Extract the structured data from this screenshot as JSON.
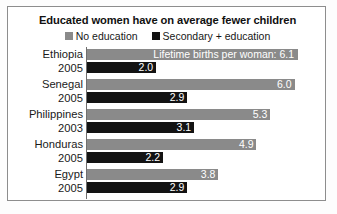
{
  "chart_data": {
    "type": "bar",
    "title": "Educated women have on average fewer children",
    "orientation": "horizontal",
    "grid": false,
    "legend_position": "top-center",
    "xlabel": "",
    "ylabel": "",
    "xlim": [
      0,
      6.1
    ],
    "categories": [
      "Ethiopia 2005",
      "Senegal 2005",
      "Philippines 2003",
      "Honduras 2005",
      "Egypt 2005"
    ],
    "series": [
      {
        "name": "No education",
        "color": "#8a8a8a",
        "values": [
          6.1,
          6.0,
          5.3,
          4.9,
          3.8
        ]
      },
      {
        "name": "Secondary + education",
        "color": "#131313",
        "values": [
          2.0,
          2.9,
          3.1,
          2.2,
          2.9
        ]
      }
    ],
    "annotations": [
      {
        "text": "Lifetime births per woman: 6.1",
        "attached_to": "Ethiopia 2005 / No education"
      }
    ]
  },
  "chart": {
    "title": "Educated women have on average fewer children",
    "legend": [
      {
        "label": "No education",
        "swatch": "gray-swatch-icon"
      },
      {
        "label": "Secondary + education",
        "swatch": "black-swatch-icon"
      }
    ],
    "groups": [
      {
        "country": "Ethiopia",
        "year": "2005",
        "no_education": {
          "value": 6.1,
          "label": "Lifetime births per woman: 6.1"
        },
        "secondary_education": {
          "value": 2.0,
          "label": "2.0"
        }
      },
      {
        "country": "Senegal",
        "year": "2005",
        "no_education": {
          "value": 6.0,
          "label": "6.0"
        },
        "secondary_education": {
          "value": 2.9,
          "label": "2.9"
        }
      },
      {
        "country": "Philippines",
        "year": "2003",
        "no_education": {
          "value": 5.3,
          "label": "5.3"
        },
        "secondary_education": {
          "value": 3.1,
          "label": "3.1"
        }
      },
      {
        "country": "Honduras",
        "year": "2005",
        "no_education": {
          "value": 4.9,
          "label": "4.9"
        },
        "secondary_education": {
          "value": 2.2,
          "label": "2.2"
        }
      },
      {
        "country": "Egypt",
        "year": "2005",
        "no_education": {
          "value": 3.8,
          "label": "3.8"
        },
        "secondary_education": {
          "value": 2.9,
          "label": "2.9"
        }
      }
    ]
  }
}
